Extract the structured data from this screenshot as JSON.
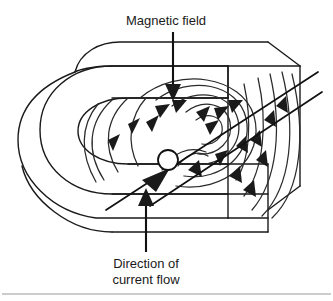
{
  "figure": {
    "background_color": "#ffffff",
    "line_color": "#1a1a1a",
    "field_line_color": "#2b2b2b",
    "text_color": "#1a1a1a",
    "rule_color": "#9a9a9a"
  },
  "labels": {
    "magnetic_field": "Magnetic field",
    "current_flow_line1": "Direction of",
    "current_flow_line2": "current flow"
  },
  "annotations": {
    "magnetic_field_arrow_direction": "down",
    "current_flow_arrow_direction": "up",
    "current_wire_direction": "lower-left to upper-right"
  },
  "elements": {
    "magnet_name": "horseshoe-magnet",
    "conductor_name": "current-carrying-wire",
    "conductor_cross_section": "wire-cross-section-circle",
    "field_lines_count": 14,
    "field_arrowheads_count": 18
  }
}
